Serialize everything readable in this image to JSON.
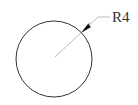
{
  "drawing": {
    "shape": "circle",
    "dimension": {
      "type": "radius",
      "label": "R4"
    },
    "colors": {
      "outline": "#333333",
      "leader": "#aaaaaa",
      "arrow": "#111111",
      "background": "#ffffff"
    }
  }
}
